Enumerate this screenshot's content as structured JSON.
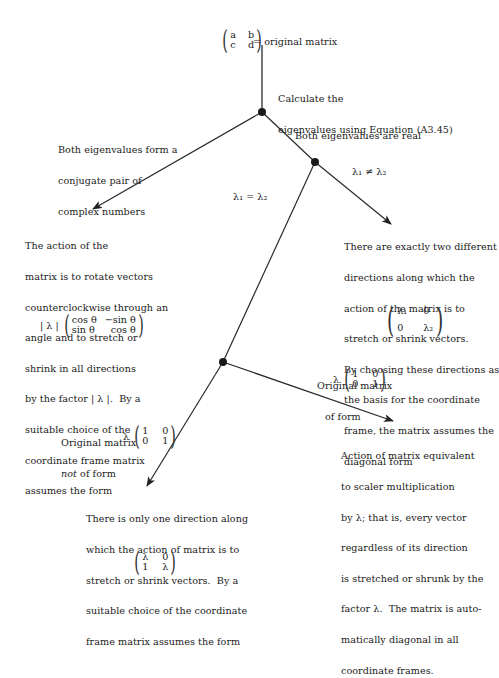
{
  "top": {
    "matrix": {
      "cells": [
        "a",
        "b",
        "c",
        "d"
      ]
    },
    "label": "= original matrix"
  },
  "step_calculate": [
    "Calculate the",
    "eigenvalues using Equation (A3.45)"
  ],
  "branch_complex": {
    "label": [
      "Both eigenvalues form a",
      "conjugate pair of",
      "complex numbers"
    ],
    "result": [
      "The action of the",
      "matrix is to rotate vectors",
      "counterclockwise through an",
      "angle and to stretch or",
      "shrink in all directions",
      "by the factor | λ |.  By a",
      "suitable choice of the",
      "coordinate frame matrix",
      "assumes the form"
    ],
    "matrix": {
      "prefix": "| λ |",
      "cells": [
        "cos θ",
        "−sin θ",
        "sin θ",
        "cos θ"
      ]
    }
  },
  "branch_real": {
    "label": "Both eigenvalues are real",
    "distinct_label": "λ₁ ≠ λ₂",
    "distinct_result": [
      "There are exactly two different",
      "directions along which the",
      "action of the matrix is to",
      "stretch or shrink vectors.",
      "By choosing these directions as",
      "the basis for the coordinate",
      "frame, the matrix assumes the",
      "diagonal form"
    ],
    "distinct_matrix": {
      "cells": [
        "λ₁",
        "0",
        "0",
        "λ₂"
      ]
    },
    "equal_label": "λ₁ = λ₂"
  },
  "branch_equal": {
    "not_form_label": [
      "Original matrix",
      "not of form"
    ],
    "not_form_italic": "not",
    "not_form_matrix": {
      "prefix": "λ",
      "cells": [
        "1",
        "0",
        "0",
        "1"
      ]
    },
    "form_label": [
      "Original matrix",
      "of form"
    ],
    "form_matrix": {
      "prefix": "λ",
      "cells": [
        "1",
        "0",
        "0",
        "1"
      ]
    },
    "form_result": [
      "Action of matrix equivalent",
      "to scaler multiplication",
      "by λ; that is, every vector",
      "regardless of its direction",
      "is stretched or shrunk by the",
      "factor λ.  The matrix is auto-",
      "matically diagonal in all",
      "coordinate frames."
    ],
    "not_form_result": [
      "There is only one direction along",
      "which the action of matrix is to",
      "stretch or shrink vectors.  By a",
      "suitable choice of the coordinate",
      "frame matrix assumes the form"
    ],
    "not_form_result_matrix": {
      "cells": [
        "λ",
        "0",
        "1",
        "λ"
      ]
    }
  },
  "colors": {
    "ink": "#1a1a1a",
    "line": "#2a2a2a",
    "background": "#ffffff"
  }
}
